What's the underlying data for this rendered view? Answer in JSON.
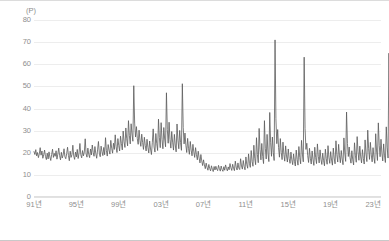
{
  "chart_data": {
    "type": "line",
    "title": "",
    "subtitle": "",
    "xlabel": "",
    "ylabel": "",
    "unit_label": "(P)",
    "ylim": [
      0,
      80
    ],
    "ytick_step": 10,
    "yticks": [
      "80",
      "70",
      "60",
      "50",
      "40",
      "30",
      "20",
      "10",
      "0"
    ],
    "ytick_values": [
      80,
      70,
      60,
      50,
      40,
      30,
      20,
      10,
      0
    ],
    "grid": true,
    "legend": null,
    "legend_position": "none",
    "xticks": [
      "91년",
      "95년",
      "99년",
      "03년",
      "07년",
      "11년",
      "15년",
      "19년",
      "23년"
    ],
    "xtick_values": [
      1991,
      1995,
      1999,
      2003,
      2007,
      2011,
      2015,
      2019,
      2023
    ],
    "xlim": [
      1991,
      2023.75
    ],
    "line_color": "#5a5a5a",
    "line_width": 0.8,
    "x_start": 1991.0,
    "x_step": 0.08333,
    "series": [
      {
        "name": "index",
        "values": [
          20.5,
          19.2,
          21.4,
          18.6,
          20.1,
          17.8,
          19.5,
          22.3,
          18.9,
          20.8,
          17.5,
          19.1,
          21.2,
          18.3,
          16.9,
          19.8,
          17.2,
          20.4,
          18.1,
          16.5,
          19.3,
          21.6,
          17.9,
          19.7,
          18.4,
          20.9,
          17.1,
          19.4,
          22.1,
          18.7,
          16.8,
          20.2,
          17.6,
          19.0,
          21.8,
          18.2,
          17.3,
          19.6,
          22.5,
          18.8,
          16.4,
          20.7,
          17.9,
          19.2,
          23.4,
          18.5,
          17.0,
          20.3,
          18.1,
          21.5,
          17.4,
          19.8,
          24.2,
          19.1,
          17.7,
          21.0,
          18.6,
          20.4,
          26.3,
          19.5,
          18.0,
          22.1,
          19.3,
          17.8,
          21.7,
          19.0,
          23.5,
          20.2,
          18.4,
          22.8,
          19.6,
          17.5,
          21.3,
          25.1,
          19.8,
          18.2,
          23.0,
          20.5,
          18.7,
          22.4,
          19.1,
          26.8,
          20.9,
          18.5,
          23.7,
          21.2,
          19.4,
          25.6,
          22.0,
          19.8,
          24.3,
          21.5,
          28.1,
          22.7,
          20.1,
          26.4,
          23.2,
          20.8,
          27.5,
          24.1,
          21.3,
          29.8,
          25.0,
          22.4,
          31.2,
          26.3,
          23.1,
          34.5,
          27.8,
          24.0,
          33.1,
          28.5,
          25.2,
          50.3,
          33.4,
          27.1,
          31.8,
          26.4,
          23.8,
          30.2,
          25.6,
          22.9,
          28.4,
          24.7,
          21.5,
          27.0,
          23.3,
          20.8,
          26.1,
          22.4,
          19.9,
          25.3,
          21.7,
          19.2,
          24.5,
          30.8,
          22.6,
          20.3,
          28.7,
          24.1,
          21.0,
          35.2,
          26.8,
          22.3,
          33.6,
          25.9,
          21.8,
          31.4,
          26.2,
          22.7,
          47.1,
          30.5,
          24.3,
          33.8,
          26.0,
          22.1,
          29.6,
          24.8,
          21.2,
          28.3,
          23.5,
          20.4,
          33.0,
          25.7,
          21.8,
          30.1,
          24.6,
          21.1,
          51.2,
          31.5,
          24.0,
          28.9,
          23.4,
          20.1,
          26.5,
          22.0,
          19.3,
          25.1,
          21.2,
          18.6,
          23.8,
          20.4,
          17.9,
          22.3,
          19.1,
          16.8,
          20.7,
          17.6,
          15.4,
          19.2,
          16.3,
          14.2,
          16.8,
          14.5,
          12.8,
          15.3,
          13.4,
          12.1,
          14.7,
          12.9,
          11.8,
          14.1,
          12.5,
          11.5,
          13.8,
          12.2,
          13.9,
          12.6,
          11.9,
          14.3,
          12.8,
          11.7,
          14.0,
          12.4,
          11.6,
          13.7,
          12.1,
          14.5,
          12.9,
          11.8,
          13.6,
          12.3,
          15.1,
          13.2,
          12.0,
          14.8,
          13.0,
          11.9,
          16.2,
          13.5,
          12.2,
          15.4,
          13.1,
          12.4,
          17.3,
          14.0,
          12.6,
          16.5,
          13.8,
          12.3,
          18.1,
          14.7,
          13.0,
          19.5,
          15.2,
          13.4,
          21.0,
          16.1,
          13.9,
          23.4,
          17.5,
          14.6,
          26.8,
          19.2,
          15.5,
          31.0,
          21.4,
          16.8,
          24.2,
          18.3,
          15.1,
          34.5,
          22.0,
          17.2,
          28.3,
          19.8,
          16.0,
          38.2,
          24.5,
          18.4,
          27.1,
          20.2,
          16.5,
          71.0,
          35.4,
          24.1,
          30.5,
          22.3,
          18.0,
          26.4,
          20.1,
          16.9,
          24.8,
          19.3,
          16.2,
          23.1,
          18.5,
          15.8,
          21.7,
          17.4,
          15.2,
          20.3,
          16.8,
          14.6,
          19.5,
          16.1,
          14.0,
          21.2,
          17.0,
          14.4,
          22.8,
          17.9,
          15.0,
          25.6,
          19.4,
          15.9,
          63.2,
          31.0,
          21.5,
          24.3,
          18.7,
          15.6,
          22.0,
          17.5,
          14.9,
          20.8,
          16.9,
          14.3,
          22.5,
          17.8,
          15.1,
          24.0,
          18.4,
          15.4,
          21.3,
          17.1,
          14.7,
          19.8,
          16.4,
          14.1,
          21.6,
          17.3,
          14.8,
          23.2,
          18.0,
          15.2,
          20.5,
          16.7,
          14.4,
          22.1,
          17.6,
          15.0,
          25.4,
          19.1,
          15.8,
          23.8,
          18.6,
          15.5,
          21.0,
          17.2,
          14.6,
          26.7,
          19.8,
          16.1,
          38.4,
          24.2,
          18.3,
          22.6,
          17.7,
          15.3,
          20.9,
          16.8,
          14.5,
          24.5,
          18.9,
          15.7,
          27.3,
          20.4,
          16.6,
          23.0,
          18.1,
          15.4,
          21.4,
          17.4,
          14.9,
          25.8,
          19.6,
          16.0,
          30.2,
          21.8,
          17.0,
          24.7,
          19.0,
          15.9,
          22.3,
          17.9,
          15.2,
          28.6,
          20.8,
          16.5,
          33.5,
          23.4,
          18.2,
          26.1,
          19.9,
          16.3,
          24.0,
          18.6,
          15.6,
          31.7,
          22.5,
          17.6,
          65.0,
          33.0,
          22.8,
          28.4,
          21.0,
          17.3,
          25.2,
          19.4,
          16.2,
          23.5,
          18.3,
          15.5,
          27.0,
          20.2,
          16.7,
          24.4,
          18.8,
          15.8,
          22.7,
          18.0,
          15.3,
          26.3,
          19.7,
          16.4,
          23.9,
          18.5,
          15.7,
          21.8,
          17.6,
          19.2,
          20.1,
          18.4,
          21.0,
          19.5,
          17.8,
          20.6,
          19.0,
          21.3,
          19.8,
          18.2,
          20.4,
          19.3
        ]
      }
    ]
  }
}
